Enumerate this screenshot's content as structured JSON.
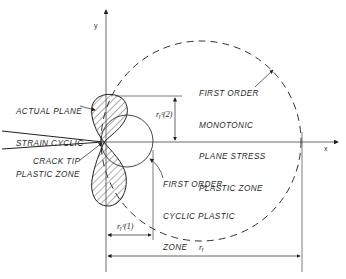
{
  "diagram": {
    "axes": {
      "x_label": "x",
      "y_label": "y"
    },
    "labels": {
      "actual_zone": [
        "ACTUAL PLANE",
        "STRAIN CYCLIC",
        "PLASTIC ZONE"
      ],
      "monotonic_zone": [
        "FIRST ORDER",
        "MONOTONIC",
        "PLANE STRESS",
        "PLASTIC ZONE"
      ],
      "crack_tip": "CRACK TIP",
      "cyclic_zone": [
        "FIRST ORDER",
        "CYCLIC PLASTIC",
        "ZONE"
      ]
    },
    "dimensions": {
      "ry_c2": "rᵧᶜ(2)",
      "ry_c1": "rᵧᶜ(1)",
      "ry": "rᵧ"
    },
    "colors": {
      "line": "#2a2a2a",
      "background": "#ffffff"
    }
  }
}
